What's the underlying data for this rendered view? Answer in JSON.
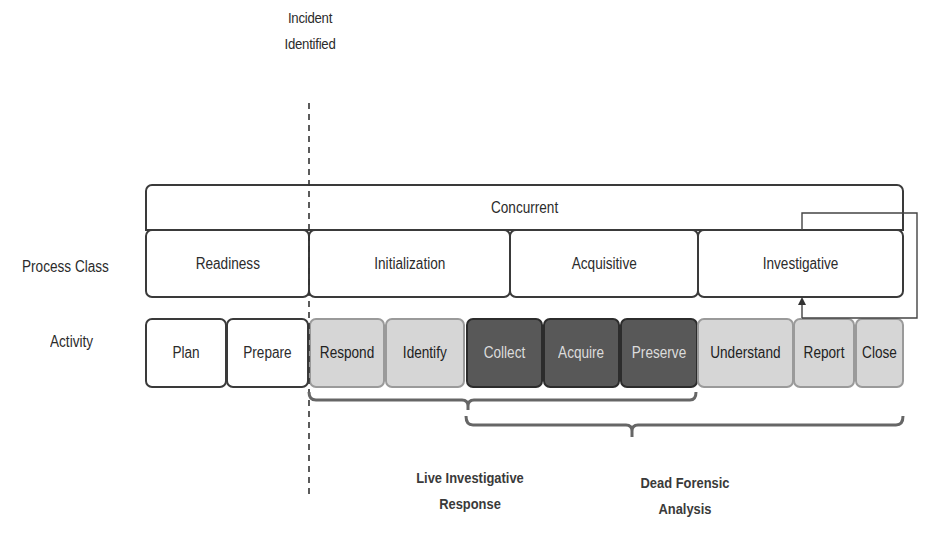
{
  "milestone": {
    "label_line1": "Incident",
    "label_line2": "Identified"
  },
  "rows": {
    "process_class_label": "Process Class",
    "activity_label": "Activity"
  },
  "concurrent": {
    "label": "Concurrent"
  },
  "process_classes": [
    {
      "label": "Readiness"
    },
    {
      "label": "Initialization"
    },
    {
      "label": "Acquisitive"
    },
    {
      "label": "Investigative"
    }
  ],
  "activities": [
    {
      "label": "Plan",
      "shade": "white"
    },
    {
      "label": "Prepare",
      "shade": "white"
    },
    {
      "label": "Respond",
      "shade": "light"
    },
    {
      "label": "Identify",
      "shade": "light"
    },
    {
      "label": "Collect",
      "shade": "dark"
    },
    {
      "label": "Acquire",
      "shade": "dark"
    },
    {
      "label": "Preserve",
      "shade": "dark"
    },
    {
      "label": "Understand",
      "shade": "light"
    },
    {
      "label": "Report",
      "shade": "light"
    },
    {
      "label": "Close",
      "shade": "light"
    }
  ],
  "groups": [
    {
      "label_line1": "Live Investigative",
      "label_line2": "Response",
      "spans": [
        "Respond",
        "Preserve"
      ]
    },
    {
      "label_line1": "Dead Forensic",
      "label_line2": "Analysis",
      "spans": [
        "Collect",
        "Close"
      ]
    }
  ],
  "colors": {
    "white_box": "#ffffff",
    "light_box": "#d6d6d6",
    "dark_box": "#585858",
    "outline": "#3a3a3a"
  }
}
